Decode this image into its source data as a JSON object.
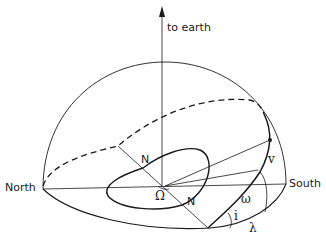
{
  "diagram": {
    "labels": {
      "to_earth": "to earth",
      "north": "North",
      "south": "South",
      "node_upper": "N",
      "node_lower": "N",
      "ascending_node": "Ω",
      "true_anomaly": "v",
      "argument_periastron": "ω",
      "inclination": "i",
      "longitude": "λ"
    },
    "colors": {
      "stroke": "#1a1a1a",
      "background": "#ffffff"
    }
  }
}
